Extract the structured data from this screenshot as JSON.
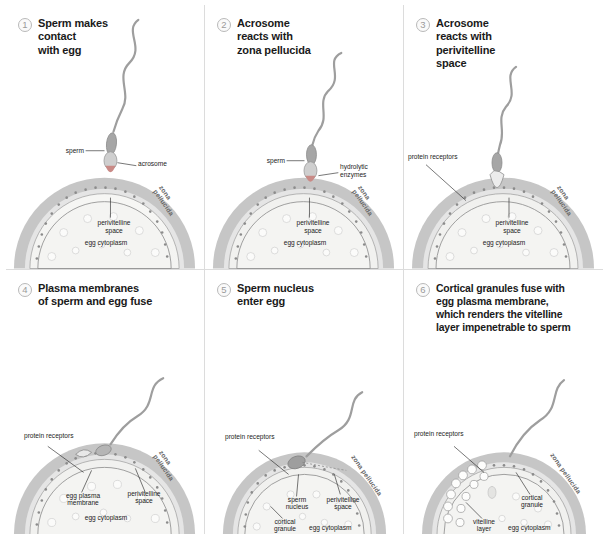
{
  "figure": {
    "colors": {
      "zona_pellucida": "#c3c3c3",
      "perivitelline_space": "#e8e8e8",
      "egg_cytoplasm": "#f2f2f0",
      "membrane_line": "#8f8f8f",
      "sperm_body": "#a0a0a0",
      "acrosome": "#c98a86",
      "badge_text": "#9a9a9a",
      "heading_text": "#1a1a1a",
      "label_text": "#1c1c1c",
      "panel_border": "#dcdcdc"
    }
  },
  "panels": [
    {
      "number": "1",
      "title": "Sperm makes\ncontact\nwith egg",
      "labels": {
        "sperm": "sperm",
        "acrosome": "acrosome",
        "zona_pellucida": "zona pellucida",
        "perivitelline_space": "perivitelline\nspace",
        "egg_cytoplasm": "egg cytoplasm"
      }
    },
    {
      "number": "2",
      "title": "Acrosome\nreacts with\nzona pellucida",
      "labels": {
        "sperm": "sperm",
        "hydrolytic_enzymes": "hydrolytic\nenzymes",
        "zona_pellucida": "zona pellucida",
        "perivitelline_space": "perivitelline\nspace",
        "egg_cytoplasm": "egg cytoplasm"
      }
    },
    {
      "number": "3",
      "title": "Acrosome\nreacts with\nperivitelline\nspace",
      "labels": {
        "protein_receptors": "protein receptors",
        "zona_pellucida": "zona pellucida",
        "perivitelline_space": "perivitelline\nspace",
        "egg_cytoplasm": "egg cytoplasm"
      }
    },
    {
      "number": "4",
      "title": "Plasma membranes\nof sperm and egg fuse",
      "labels": {
        "protein_receptors": "protein receptors",
        "egg_plasma_membrane": "egg plasma\nmembrane",
        "zona_pellucida": "zona pellucida",
        "perivitelline_space": "perivitelline\nspace",
        "egg_cytoplasm": "egg cytoplasm"
      }
    },
    {
      "number": "5",
      "title": "Sperm nucleus\nenter egg",
      "labels": {
        "protein_receptors": "protein receptors",
        "sperm_nucleus": "sperm\nnucleus",
        "cortical_granule": "cortical\ngranule",
        "zona_pellucida": "zona pellucida",
        "perivitelline_space": "perivitelline\nspace",
        "egg_cytoplasm": "egg cytoplasm"
      }
    },
    {
      "number": "6",
      "title": "Cortical granules fuse with\negg plasma membrane,\nwhich renders the vitelline\nlayer impenetrable to sperm",
      "labels": {
        "protein_receptors": "protein receptors",
        "cortical_granule": "cortical\ngranule",
        "vitelline_layer": "vitelline\nlayer",
        "zona_pellucida": "zona pellucida",
        "perivitelline_space": "perivitelline\nspace",
        "egg_cytoplasm": "egg cytoplasm"
      }
    }
  ]
}
